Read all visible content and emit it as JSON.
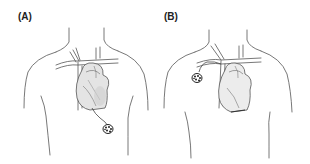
{
  "figure": {
    "panels": [
      {
        "id": "A",
        "label": "(A)",
        "device_position": "subcostal-abdominal",
        "lead_path": "inferior"
      },
      {
        "id": "B",
        "label": "(B)",
        "device_position": "left-subclavian-pectoral",
        "lead_path": "transvenous"
      }
    ],
    "colors": {
      "line": "#555555",
      "heart_shade": "#d8d8d8",
      "device": "#333333",
      "background": "#ffffff"
    }
  }
}
